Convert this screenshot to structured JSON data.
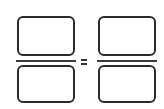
{
  "diagram": {
    "type": "equivalent-fractions-template",
    "operator": "=",
    "fractions": [
      {
        "numerator": "",
        "denominator": ""
      },
      {
        "numerator": "",
        "denominator": ""
      }
    ],
    "colors": {
      "stroke": "#2b2b2b",
      "background": "#ffffff"
    }
  }
}
